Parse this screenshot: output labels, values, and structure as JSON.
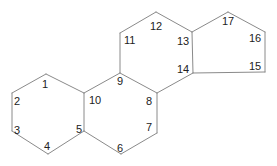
{
  "diagram": {
    "title": "",
    "type": "steroid-skeleton",
    "colors": {
      "bond": "#8a8a8a",
      "label": "#222222",
      "background": "#ffffff"
    },
    "atoms": [
      {
        "id": "1",
        "x": 46,
        "y": 74
      },
      {
        "id": "2",
        "x": 12,
        "y": 93
      },
      {
        "id": "3",
        "x": 12,
        "y": 131
      },
      {
        "id": "4",
        "x": 48,
        "y": 154
      },
      {
        "id": "5",
        "x": 84,
        "y": 131
      },
      {
        "id": "6",
        "x": 121,
        "y": 154
      },
      {
        "id": "7",
        "x": 157,
        "y": 133
      },
      {
        "id": "8",
        "x": 157,
        "y": 93
      },
      {
        "id": "9",
        "x": 120,
        "y": 73
      },
      {
        "id": "10",
        "x": 84,
        "y": 93
      },
      {
        "id": "11",
        "x": 120,
        "y": 33
      },
      {
        "id": "12",
        "x": 156,
        "y": 12
      },
      {
        "id": "13",
        "x": 192,
        "y": 32
      },
      {
        "id": "14",
        "x": 193,
        "y": 73
      },
      {
        "id": "15",
        "x": 265,
        "y": 72
      },
      {
        "id": "16",
        "x": 265,
        "y": 32
      },
      {
        "id": "17",
        "x": 228,
        "y": 12
      }
    ],
    "labels": [
      {
        "text": "1",
        "x": 42,
        "y": 88
      },
      {
        "text": "2",
        "x": 14,
        "y": 105
      },
      {
        "text": "3",
        "x": 14,
        "y": 134
      },
      {
        "text": "4",
        "x": 44,
        "y": 150
      },
      {
        "text": "5",
        "x": 76,
        "y": 133
      },
      {
        "text": "6",
        "x": 117,
        "y": 152
      },
      {
        "text": "7",
        "x": 146,
        "y": 131
      },
      {
        "text": "8",
        "x": 146,
        "y": 105
      },
      {
        "text": "9",
        "x": 117,
        "y": 85
      },
      {
        "text": "10",
        "x": 89,
        "y": 104
      },
      {
        "text": "11",
        "x": 124,
        "y": 44
      },
      {
        "text": "12",
        "x": 150,
        "y": 30
      },
      {
        "text": "13",
        "x": 177,
        "y": 45
      },
      {
        "text": "14",
        "x": 177,
        "y": 73
      },
      {
        "text": "15",
        "x": 249,
        "y": 70
      },
      {
        "text": "16",
        "x": 249,
        "y": 42
      },
      {
        "text": "17",
        "x": 222,
        "y": 25
      }
    ],
    "bonds": [
      [
        "1",
        "2"
      ],
      [
        "2",
        "3"
      ],
      [
        "3",
        "4"
      ],
      [
        "4",
        "5"
      ],
      [
        "5",
        "10"
      ],
      [
        "10",
        "1"
      ],
      [
        "5",
        "6"
      ],
      [
        "6",
        "7"
      ],
      [
        "7",
        "8"
      ],
      [
        "8",
        "9"
      ],
      [
        "9",
        "10"
      ],
      [
        "9",
        "11"
      ],
      [
        "11",
        "12"
      ],
      [
        "12",
        "13"
      ],
      [
        "13",
        "14"
      ],
      [
        "14",
        "8"
      ],
      [
        "13",
        "17"
      ],
      [
        "17",
        "16"
      ],
      [
        "16",
        "15"
      ],
      [
        "15",
        "14"
      ]
    ]
  }
}
